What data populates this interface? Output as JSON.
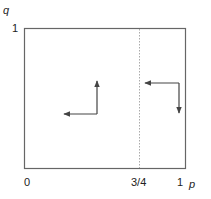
{
  "diagram": {
    "axes": {
      "x_label": "p",
      "y_label": "q",
      "x_ticks": [
        "0",
        "3/4",
        "1"
      ],
      "y_ticks": [
        "1"
      ]
    },
    "threshold": {
      "label": "3/4",
      "value": 0.75,
      "style": "dotted"
    },
    "regions": [
      {
        "name": "left-of-threshold",
        "arrows": [
          "up",
          "left"
        ]
      },
      {
        "name": "right-of-threshold",
        "arrows": [
          "left",
          "down"
        ]
      }
    ],
    "colors": {
      "line": "#555555",
      "dotted": "#aaaaaa",
      "text": "#222222"
    }
  }
}
